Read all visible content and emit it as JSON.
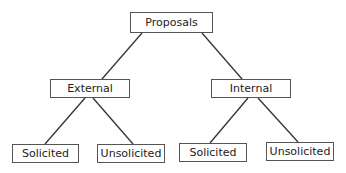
{
  "diagram": {
    "type": "tree",
    "root": {
      "id": "proposals",
      "label": "Proposals"
    },
    "nodes": [
      {
        "id": "proposals",
        "label": "Proposals",
        "x": 130,
        "y": 12,
        "w": 83,
        "h": 21
      },
      {
        "id": "external",
        "label": "External",
        "x": 50,
        "y": 79,
        "w": 80,
        "h": 19
      },
      {
        "id": "internal",
        "label": "Internal",
        "x": 211,
        "y": 79,
        "w": 80,
        "h": 19
      },
      {
        "id": "ext-solicited",
        "label": "Solicited",
        "x": 12,
        "y": 144,
        "w": 67,
        "h": 19
      },
      {
        "id": "ext-unsolicited",
        "label": "Unsolicited",
        "x": 97,
        "y": 144,
        "w": 68,
        "h": 19
      },
      {
        "id": "int-solicited",
        "label": "Solicited",
        "x": 179,
        "y": 143,
        "w": 68,
        "h": 19
      },
      {
        "id": "int-unsolicited",
        "label": "Unsolicited",
        "x": 266,
        "y": 142,
        "w": 68,
        "h": 19
      }
    ],
    "edges": [
      {
        "from": "proposals",
        "to": "external"
      },
      {
        "from": "proposals",
        "to": "internal"
      },
      {
        "from": "external",
        "to": "ext-solicited"
      },
      {
        "from": "external",
        "to": "ext-unsolicited"
      },
      {
        "from": "internal",
        "to": "int-solicited"
      },
      {
        "from": "internal",
        "to": "int-unsolicited"
      }
    ],
    "line_color": "#333333",
    "border_color": "#555555"
  }
}
